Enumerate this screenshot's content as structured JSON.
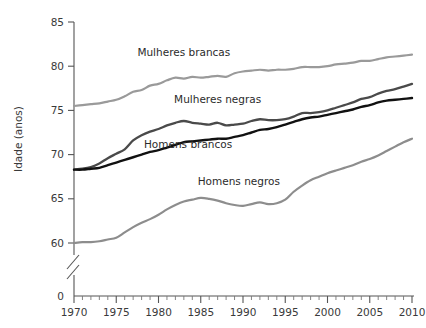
{
  "chart_data": {
    "type": "line",
    "title": "",
    "xlabel": "",
    "ylabel": "Idade (anos)",
    "xlim": [
      1970,
      2010
    ],
    "ylim": [
      58.5,
      85
    ],
    "grid": false,
    "legend_position": "inline-labels",
    "y_ticks": [
      "0",
      "60",
      "65",
      "70",
      "75",
      "80",
      "85"
    ],
    "x_ticks": [
      "1970",
      "1975",
      "1980",
      "1985",
      "1990",
      "1995",
      "2000",
      "2005",
      "2010"
    ],
    "y_axis_break": true,
    "x_minor_tick_interval": 1,
    "x_major_tick_interval": 5,
    "x": [
      1970,
      1971,
      1972,
      1973,
      1974,
      1975,
      1976,
      1977,
      1978,
      1979,
      1980,
      1981,
      1982,
      1983,
      1984,
      1985,
      1986,
      1987,
      1988,
      1989,
      1990,
      1991,
      1992,
      1993,
      1994,
      1995,
      1996,
      1997,
      1998,
      1999,
      2000,
      2001,
      2002,
      2003,
      2004,
      2005,
      2006,
      2007,
      2008,
      2009,
      2010
    ],
    "series": [
      {
        "name": "Mulheres brancas",
        "color": "#9a9a9a",
        "width": 2.2,
        "label_x": 1983.0,
        "label_y": 81.6,
        "values": [
          75.5,
          75.6,
          75.7,
          75.8,
          76.0,
          76.2,
          76.6,
          77.1,
          77.3,
          77.8,
          78.0,
          78.4,
          78.7,
          78.6,
          78.8,
          78.7,
          78.8,
          78.9,
          78.8,
          79.2,
          79.4,
          79.5,
          79.6,
          79.5,
          79.6,
          79.6,
          79.7,
          79.9,
          79.9,
          79.9,
          80.0,
          80.2,
          80.3,
          80.4,
          80.6,
          80.6,
          80.8,
          81.0,
          81.1,
          81.2,
          81.3
        ]
      },
      {
        "name": "Mulheres negras",
        "color": "#4a4a4a",
        "width": 2.3,
        "label_x": 1987.0,
        "label_y": 76.3,
        "values": [
          68.3,
          68.4,
          68.6,
          69.0,
          69.6,
          70.1,
          70.6,
          71.6,
          72.2,
          72.6,
          72.9,
          73.3,
          73.6,
          73.8,
          73.6,
          73.5,
          73.4,
          73.6,
          73.3,
          73.4,
          73.5,
          73.8,
          74.0,
          73.9,
          73.9,
          74.0,
          74.3,
          74.7,
          74.7,
          74.8,
          75.0,
          75.3,
          75.6,
          75.9,
          76.3,
          76.5,
          76.9,
          77.2,
          77.4,
          77.7,
          78.0
        ]
      },
      {
        "name": "Homens brancos",
        "color": "#111111",
        "width": 2.4,
        "label_x": 1983.5,
        "label_y": 71.2,
        "values": [
          68.3,
          68.3,
          68.4,
          68.5,
          68.8,
          69.1,
          69.4,
          69.7,
          70.0,
          70.3,
          70.5,
          70.8,
          71.1,
          71.4,
          71.5,
          71.6,
          71.7,
          71.8,
          71.8,
          72.0,
          72.2,
          72.5,
          72.8,
          72.9,
          73.1,
          73.4,
          73.7,
          74.0,
          74.2,
          74.3,
          74.5,
          74.7,
          74.9,
          75.1,
          75.4,
          75.6,
          75.9,
          76.1,
          76.2,
          76.3,
          76.4
        ]
      },
      {
        "name": "Homens negros",
        "color": "#8d8d8d",
        "width": 2.2,
        "label_x": 1989.5,
        "label_y": 67.0,
        "values": [
          60.0,
          60.1,
          60.1,
          60.2,
          60.4,
          60.6,
          61.2,
          61.8,
          62.3,
          62.7,
          63.2,
          63.8,
          64.3,
          64.7,
          64.9,
          65.1,
          65.0,
          64.8,
          64.5,
          64.3,
          64.2,
          64.4,
          64.6,
          64.4,
          64.5,
          64.9,
          65.8,
          66.5,
          67.1,
          67.5,
          67.9,
          68.2,
          68.5,
          68.8,
          69.2,
          69.5,
          69.9,
          70.4,
          70.9,
          71.4,
          71.8
        ]
      }
    ]
  }
}
